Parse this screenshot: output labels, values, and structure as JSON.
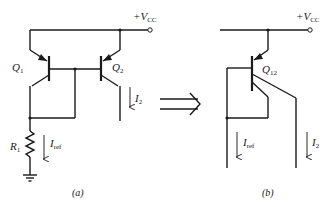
{
  "diagram": {
    "type": "circuit-schematic",
    "colors": {
      "ink": "#1a1a1a",
      "background": "#ffffff"
    },
    "panel_a": {
      "caption": "(a)",
      "supply_label": "+V",
      "supply_sub": "CC",
      "transistors": [
        {
          "name": "Q",
          "sub": "1",
          "type": "pnp"
        },
        {
          "name": "Q",
          "sub": "2",
          "type": "pnp"
        }
      ],
      "resistor": {
        "name": "R",
        "sub": "1"
      },
      "currents": [
        {
          "name": "I",
          "sub": "ref"
        },
        {
          "name": "I",
          "sub": "2"
        }
      ],
      "ground": "ground-symbol"
    },
    "transform_arrow": "double-arrow-right",
    "panel_b": {
      "caption": "(b)",
      "supply_label": "+V",
      "supply_sub": "CC",
      "transistor": {
        "name": "Q",
        "sub": "12",
        "type": "pnp-multi-collector"
      },
      "currents": [
        {
          "name": "I",
          "sub": "ref"
        },
        {
          "name": "I",
          "sub": "2"
        }
      ]
    }
  }
}
